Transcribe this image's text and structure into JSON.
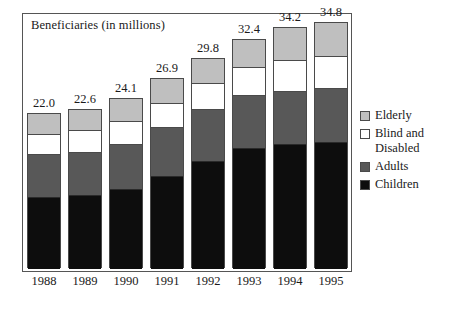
{
  "chart_data": {
    "type": "bar",
    "title": "Beneficiaries (in millions)",
    "xlabel": "",
    "ylabel": "",
    "ylim": [
      0,
      36
    ],
    "grid": false,
    "stacked": true,
    "legend_position": "right",
    "categories": [
      "1988",
      "1989",
      "1990",
      "1991",
      "1992",
      "1993",
      "1994",
      "1995"
    ],
    "totals": [
      "22.0",
      "22.6",
      "24.1",
      "26.9",
      "29.8",
      "32.4",
      "34.2",
      "34.8"
    ],
    "total_values": [
      22.0,
      22.6,
      24.1,
      26.9,
      29.8,
      32.4,
      34.2,
      34.8
    ],
    "series": [
      {
        "name": "Children",
        "color": "#0d0d0d",
        "values": [
          10.0,
          10.3,
          11.2,
          13.1,
          15.2,
          17.0,
          17.6,
          17.9
        ]
      },
      {
        "name": "Adults",
        "color": "#585858",
        "values": [
          6.1,
          6.2,
          6.4,
          6.9,
          7.3,
          7.5,
          7.5,
          7.6
        ]
      },
      {
        "name": "Blind and Disabled",
        "color": "#ffffff",
        "values": [
          2.9,
          3.0,
          3.2,
          3.4,
          3.7,
          4.0,
          4.4,
          4.6
        ]
      },
      {
        "name": "Elderly",
        "color": "#bfbfbf",
        "values": [
          3.0,
          3.1,
          3.3,
          3.5,
          3.6,
          3.9,
          4.7,
          4.7
        ]
      }
    ],
    "legend": [
      {
        "label": "Elderly",
        "color": "#bfbfbf"
      },
      {
        "label": "Blind and",
        "label2": "Disabled",
        "color": "#ffffff"
      },
      {
        "label": "Adults",
        "color": "#585858"
      },
      {
        "label": "Children",
        "color": "#0d0d0d"
      }
    ]
  },
  "legend": {
    "items": [
      {
        "label": "Elderly"
      },
      {
        "label": "Blind and"
      },
      {
        "label": "Disabled"
      },
      {
        "label": "Adults"
      },
      {
        "label": "Children"
      }
    ]
  }
}
